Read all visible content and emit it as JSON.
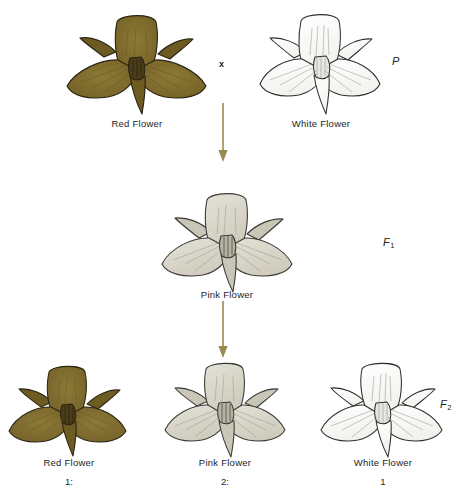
{
  "diagram": {
    "background_color": "#ffffff"
  },
  "colors": {
    "red_flower_fill": "#7e6a2c",
    "red_flower_fill_light": "#8d7936",
    "red_flower_outline": "#2b2414",
    "pink_flower_fill": "#d7d3c5",
    "pink_flower_fill_light": "#e3e0d5",
    "pink_flower_outline": "#3a3a36",
    "white_flower_fill": "#fdfdfb",
    "white_flower_fill_light": "#ffffff",
    "white_flower_outline": "#2e2e2e",
    "arrow_color": "#9a8a52",
    "text_color": "#1d1d1d"
  },
  "generations": {
    "parental": {
      "label": "P",
      "label_subscript": "",
      "cross_symbol": "x",
      "organisms": [
        {
          "name": "red-flower",
          "caption": "Red Flower",
          "phenotype": "red"
        },
        {
          "name": "white-flower",
          "caption": "White Flower",
          "phenotype": "white"
        }
      ]
    },
    "f1": {
      "label": "F",
      "label_subscript": "1",
      "organisms": [
        {
          "name": "pink-flower",
          "caption": "Pink Flower",
          "phenotype": "pink"
        }
      ]
    },
    "f2": {
      "label": "F",
      "label_subscript": "2",
      "organisms": [
        {
          "name": "red-flower",
          "caption": "Red Flower",
          "phenotype": "red",
          "ratio": "1:"
        },
        {
          "name": "pink-flower",
          "caption": "Pink Flower",
          "phenotype": "pink",
          "ratio": "2:"
        },
        {
          "name": "white-flower",
          "caption": "White Flower",
          "phenotype": "white",
          "ratio": "1"
        }
      ],
      "ratio_summary": "1:2:1"
    }
  },
  "arrows": [
    {
      "name": "p-to-f1-arrow",
      "direction": "down"
    },
    {
      "name": "f1-to-f2-arrow",
      "direction": "down"
    }
  ]
}
